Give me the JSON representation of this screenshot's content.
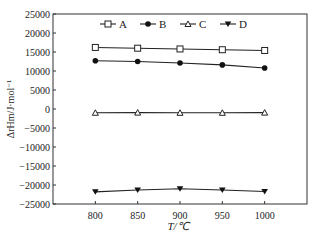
{
  "chart_data": {
    "type": "line",
    "title": "",
    "xlabel": "T/℃",
    "ylabel": "ΔrHm/J·mol⁻¹",
    "x": [
      800,
      850,
      900,
      950,
      1000
    ],
    "xticks": [
      "800",
      "850",
      "900",
      "950",
      "1000"
    ],
    "xlim": [
      750,
      1050
    ],
    "ylim": [
      -25000,
      25000
    ],
    "yticks": [
      "25000",
      "20000",
      "15000",
      "10000",
      "5000",
      "0",
      "-5000",
      "-10000",
      "-15000",
      "-20000",
      "-25000"
    ],
    "grid": false,
    "legend_position": "top-inside",
    "series": [
      {
        "name": "A",
        "marker": "open-square",
        "values": [
          16200,
          16000,
          15800,
          15600,
          15400
        ]
      },
      {
        "name": "B",
        "marker": "filled-circle",
        "values": [
          12700,
          12500,
          12100,
          11600,
          10800
        ]
      },
      {
        "name": "C",
        "marker": "open-triangle-up",
        "values": [
          -1000,
          -950,
          -1000,
          -1000,
          -950
        ]
      },
      {
        "name": "D",
        "marker": "filled-triangle-down",
        "values": [
          -21800,
          -21300,
          -21000,
          -21300,
          -21700
        ]
      }
    ]
  },
  "colors": {
    "line": "#222222",
    "axis": "#333333",
    "background": "#ffffff"
  }
}
